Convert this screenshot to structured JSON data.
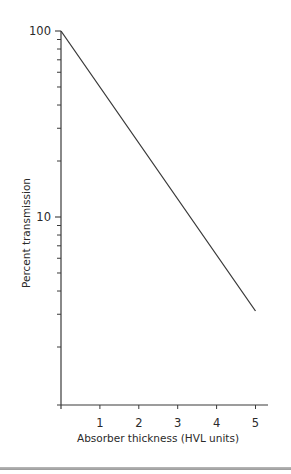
{
  "chart_data": {
    "type": "line",
    "title": "",
    "xlabel": "Absorber thickness (HVL units)",
    "ylabel": "Percent transmission",
    "xscale": "linear",
    "yscale": "log",
    "xlim": [
      0,
      5
    ],
    "ylim": [
      1,
      100
    ],
    "x_ticks": [
      1,
      2,
      3,
      4,
      5
    ],
    "x_tick_labels": [
      "1",
      "2",
      "3",
      "4",
      "5"
    ],
    "y_major_ticks": [
      100,
      10
    ],
    "y_major_tick_labels": [
      "100",
      "10"
    ],
    "y_minor_ticks": [
      90,
      80,
      70,
      60,
      50,
      40,
      30,
      20,
      9,
      8,
      7,
      6,
      5,
      4,
      3,
      2
    ],
    "grid": false,
    "legend": null,
    "series": [
      {
        "name": "Transmission",
        "color": "#3a3a3a",
        "x": [
          0,
          1,
          2,
          3,
          4,
          5
        ],
        "y": [
          100,
          50,
          25,
          12.5,
          6.25,
          3.125
        ]
      }
    ]
  },
  "colors": {
    "axis": "#3a3a3a",
    "separator": "#a8a8a8"
  }
}
